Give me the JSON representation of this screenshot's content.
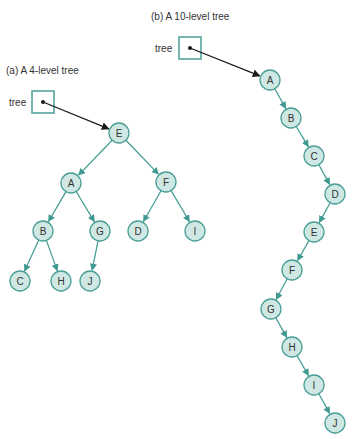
{
  "colors": {
    "node_fill": "#cfe8e4",
    "node_stroke": "#4a9e96",
    "edge": "#3f9990",
    "pointer": "#1a1a1a",
    "box_stroke": "#4a9e96"
  },
  "panel_a": {
    "title": "(a) A 4-level tree",
    "pointer_label": "tree",
    "box": {
      "x": 32,
      "y": 91,
      "w": 22,
      "h": 22
    },
    "root": "E",
    "nodes": [
      {
        "id": "E",
        "x": 119,
        "y": 133
      },
      {
        "id": "A",
        "x": 71,
        "y": 183
      },
      {
        "id": "F",
        "x": 166,
        "y": 182
      },
      {
        "id": "B",
        "x": 43,
        "y": 231
      },
      {
        "id": "G",
        "x": 100,
        "y": 231
      },
      {
        "id": "D",
        "x": 138,
        "y": 231
      },
      {
        "id": "I",
        "x": 195,
        "y": 231
      },
      {
        "id": "C",
        "x": 20,
        "y": 281
      },
      {
        "id": "H",
        "x": 61,
        "y": 281
      },
      {
        "id": "J",
        "x": 90,
        "y": 281
      }
    ],
    "edges": [
      [
        "E",
        "A"
      ],
      [
        "E",
        "F"
      ],
      [
        "A",
        "B"
      ],
      [
        "A",
        "G"
      ],
      [
        "F",
        "D"
      ],
      [
        "F",
        "I"
      ],
      [
        "B",
        "C"
      ],
      [
        "B",
        "H"
      ],
      [
        "G",
        "J"
      ]
    ]
  },
  "panel_b": {
    "title": "(b) A 10-level tree",
    "pointer_label": "tree",
    "box": {
      "x": 179,
      "y": 37,
      "w": 22,
      "h": 22
    },
    "root": "A",
    "nodes": [
      {
        "id": "A",
        "x": 270,
        "y": 80
      },
      {
        "id": "B",
        "x": 291,
        "y": 118
      },
      {
        "id": "C",
        "x": 314,
        "y": 156
      },
      {
        "id": "D",
        "x": 335,
        "y": 194
      },
      {
        "id": "E",
        "x": 314,
        "y": 232
      },
      {
        "id": "F",
        "x": 292,
        "y": 270
      },
      {
        "id": "G",
        "x": 271,
        "y": 309
      },
      {
        "id": "H",
        "x": 292,
        "y": 347
      },
      {
        "id": "I",
        "x": 314,
        "y": 385
      },
      {
        "id": "J",
        "x": 335,
        "y": 423
      }
    ],
    "edges": [
      [
        "A",
        "B"
      ],
      [
        "B",
        "C"
      ],
      [
        "C",
        "D"
      ],
      [
        "D",
        "E"
      ],
      [
        "E",
        "F"
      ],
      [
        "F",
        "G"
      ],
      [
        "G",
        "H"
      ],
      [
        "H",
        "I"
      ],
      [
        "I",
        "J"
      ]
    ]
  }
}
